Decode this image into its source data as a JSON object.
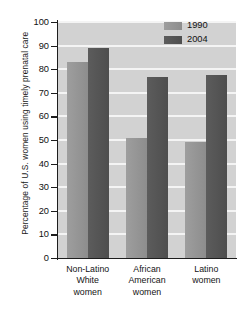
{
  "chart_data": {
    "type": "bar",
    "title": "",
    "subtitle": "",
    "xlabel": "",
    "ylabel": "Percentage of U.S. women using timely prenatal care",
    "ylim": [
      0,
      100
    ],
    "yticks": [
      0,
      10,
      20,
      30,
      40,
      50,
      60,
      70,
      80,
      90,
      100
    ],
    "ytick_labels": [
      "0",
      "10",
      "20",
      "30",
      "40",
      "50",
      "60",
      "70",
      "80",
      "90",
      "100"
    ],
    "grid": true,
    "legend_position": "top-right",
    "categories": [
      "Non-Latino White women",
      "African American women",
      "Latino women"
    ],
    "category_lines": [
      [
        "Non-Latino",
        "White",
        "women"
      ],
      [
        "African",
        "American",
        "women"
      ],
      [
        "Latino",
        "women"
      ]
    ],
    "series": [
      {
        "name": "1990",
        "color": "#949494",
        "values": [
          83,
          51,
          49
        ]
      },
      {
        "name": "2004",
        "color": "#545454",
        "values": [
          89,
          76.5,
          77.5
        ]
      }
    ]
  },
  "legend": {
    "items": [
      {
        "label": "1990",
        "color": "#949494"
      },
      {
        "label": "2004",
        "color": "#545454"
      }
    ]
  },
  "colors": {
    "plot_background": "#d2d2d2",
    "gridline": "#f4f4f4",
    "axis": "#1d1d1d",
    "text": "#111111",
    "series_1990": "#949494",
    "series_2004": "#545454"
  }
}
